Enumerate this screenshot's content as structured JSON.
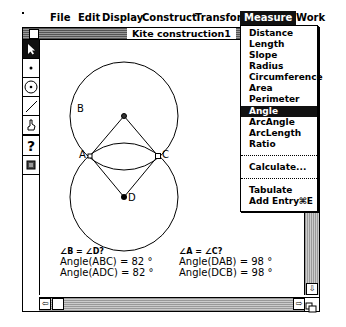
{
  "menubar": {
    "apple_icon": "apple-icon",
    "items": [
      {
        "label": "File"
      },
      {
        "label": "Edit"
      },
      {
        "label": "Display"
      },
      {
        "label": "Construct"
      },
      {
        "label": "Transform"
      },
      {
        "label": "Measure",
        "active": true
      },
      {
        "label": "Work"
      }
    ]
  },
  "window": {
    "title": "Kite construction1"
  },
  "toolbox": {
    "tools": [
      {
        "name": "arrow-tool",
        "glyph": "➤",
        "selected": true
      },
      {
        "name": "point-tool",
        "glyph": "•"
      },
      {
        "name": "circle-tool",
        "glyph": "⊙"
      },
      {
        "name": "segment-tool",
        "glyph": "/"
      },
      {
        "name": "text-tool",
        "glyph": "✍"
      },
      {
        "name": "info-tool",
        "glyph": "?"
      },
      {
        "name": "script-tool",
        "glyph": "▣"
      }
    ]
  },
  "canvas": {
    "points": {
      "A": {
        "label": "A"
      },
      "B": {
        "label": "B"
      },
      "C": {
        "label": "C"
      },
      "D": {
        "label": "D"
      }
    }
  },
  "measurements": {
    "left": {
      "question": "∠B = ∠D?",
      "line1": "Angle(ABC) = 82 °",
      "line2": "Angle(ADC) = 82 °"
    },
    "right": {
      "question": "∠A = ∠C?",
      "line1": "Angle(DAB) = 98 °",
      "line2": "Angle(DCB) = 98 °"
    }
  },
  "measure_menu": {
    "items": [
      {
        "label": "Distance"
      },
      {
        "label": "Length"
      },
      {
        "label": "Slope"
      },
      {
        "label": "Radius"
      },
      {
        "label": "Circumference"
      },
      {
        "label": "Area"
      },
      {
        "label": "Perimeter"
      },
      {
        "label": "Angle",
        "highlighted": true
      },
      {
        "label": "ArcAngle"
      },
      {
        "label": "ArcLength"
      },
      {
        "label": "Ratio"
      },
      {
        "label": "Calculate..."
      },
      {
        "label": "Tabulate"
      },
      {
        "label": "Add Entry",
        "shortcut": "⌘E"
      }
    ]
  }
}
